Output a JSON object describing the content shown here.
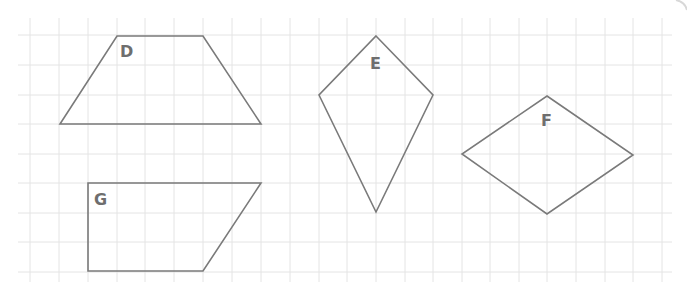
{
  "diagram": {
    "type": "shapes-on-grid",
    "grid": {
      "x_lines": [
        30,
        59,
        88,
        117,
        145,
        174,
        203,
        232,
        261,
        290,
        319,
        347,
        376,
        405,
        433,
        462,
        490,
        519,
        547,
        576,
        605,
        633,
        662
      ],
      "y_lines": [
        35,
        65,
        95,
        124,
        154,
        183,
        213,
        242,
        272
      ],
      "x_start": 18,
      "x_end": 672,
      "y_start": 18,
      "y_end": 282,
      "color": "#e4e4e4"
    },
    "stroke_color": "#7a7a7a",
    "shapes": [
      {
        "label": "D",
        "kind": "trapezoid",
        "points": [
          [
            117,
            36
          ],
          [
            203,
            36
          ],
          [
            261,
            124
          ],
          [
            60,
            124
          ]
        ],
        "label_pos": [
          120,
          57
        ]
      },
      {
        "label": "E",
        "kind": "kite",
        "points": [
          [
            376,
            36
          ],
          [
            433,
            95
          ],
          [
            376,
            212
          ],
          [
            319,
            95
          ]
        ],
        "label_pos": [
          370,
          69
        ]
      },
      {
        "label": "F",
        "kind": "rhombus",
        "points": [
          [
            547,
            96
          ],
          [
            633,
            155
          ],
          [
            547,
            214
          ],
          [
            462,
            154
          ]
        ],
        "label_pos": [
          541,
          126
        ]
      },
      {
        "label": "G",
        "kind": "right-trapezoid",
        "points": [
          [
            88,
            183
          ],
          [
            261,
            183
          ],
          [
            203,
            271
          ],
          [
            88,
            271
          ]
        ],
        "label_pos": [
          94,
          205
        ]
      }
    ]
  }
}
